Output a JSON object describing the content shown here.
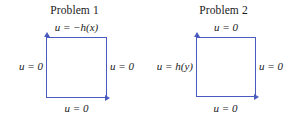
{
  "figure": {
    "accent_color": "#4a5bbf",
    "background_color": "#ffffff",
    "text_color": "#1a1a1a"
  },
  "panels": [
    {
      "title": "Problem 1",
      "boundary_conditions": {
        "top": "u = −h(x)",
        "right": "u = 0",
        "bottom": "u = 0",
        "left": "u = 0"
      },
      "axis_arrows": {
        "vertical": "arrow-up-icon",
        "horizontal": "arrow-right-icon"
      }
    },
    {
      "title": "Problem 2",
      "boundary_conditions": {
        "top": "u = 0",
        "right": "u = 0",
        "bottom": "u = 0",
        "left": "u = h(y)"
      },
      "axis_arrows": {
        "vertical": "arrow-up-icon",
        "horizontal": "arrow-right-icon"
      }
    }
  ]
}
